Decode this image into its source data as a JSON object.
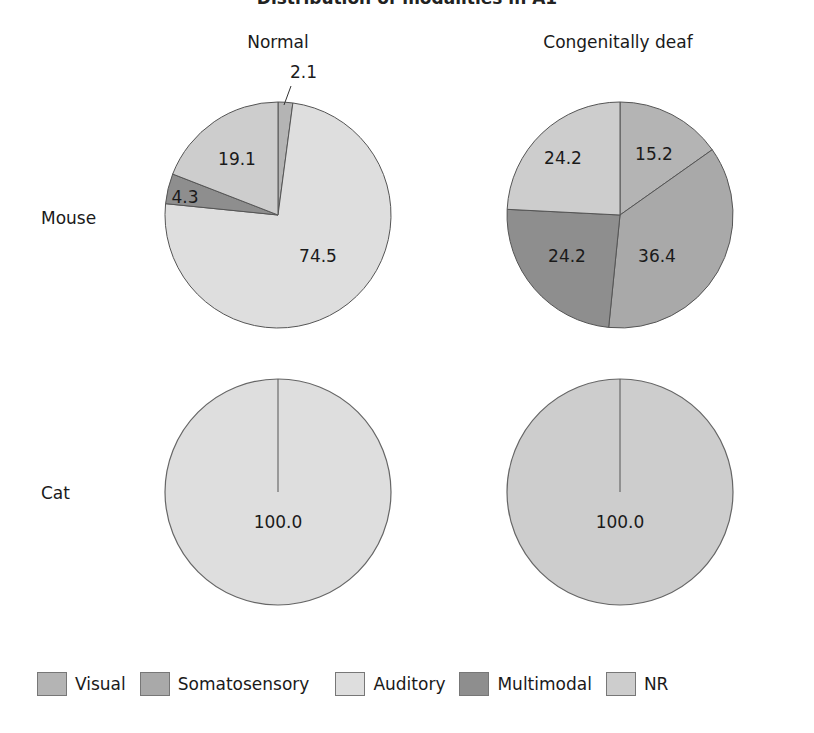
{
  "title": "Distribution of modalities in A1",
  "columns": [
    "Normal",
    "Congenitally deaf"
  ],
  "rows": [
    "Mouse",
    "Cat"
  ],
  "colors": {
    "Visual": "#b4b4b4",
    "Somatosensory": "#a9a9a9",
    "Auditory": "#dedede",
    "Multimodal": "#8e8e8e",
    "NR": "#cdcdcd"
  },
  "legend": [
    {
      "label": "Visual",
      "color": "#b4b4b4"
    },
    {
      "label": "Somatosensory",
      "color": "#a9a9a9"
    },
    {
      "label": "Auditory",
      "color": "#dedede"
    },
    {
      "label": "Multimodal",
      "color": "#8e8e8e"
    },
    {
      "label": "NR",
      "color": "#cdcdcd"
    }
  ],
  "chart_data": [
    {
      "type": "pie",
      "title": "Mouse - Normal",
      "categories": [
        "Visual",
        "Auditory",
        "Multimodal",
        "NR"
      ],
      "values": [
        2.1,
        74.5,
        4.3,
        19.1
      ],
      "labels": [
        "2.1",
        "74.5",
        "4.3",
        "19.1"
      ]
    },
    {
      "type": "pie",
      "title": "Mouse - Congenitally deaf",
      "categories": [
        "Visual",
        "Somatosensory",
        "Multimodal",
        "NR"
      ],
      "values": [
        15.2,
        36.4,
        24.2,
        24.2
      ],
      "labels": [
        "15.2",
        "36.4",
        "24.2",
        "24.2"
      ]
    },
    {
      "type": "pie",
      "title": "Cat - Normal",
      "categories": [
        "Auditory"
      ],
      "values": [
        100.0
      ],
      "labels": [
        "100.0"
      ]
    },
    {
      "type": "pie",
      "title": "Cat - Congenitally deaf",
      "categories": [
        "NR"
      ],
      "values": [
        100.0
      ],
      "labels": [
        "100.0"
      ]
    }
  ]
}
